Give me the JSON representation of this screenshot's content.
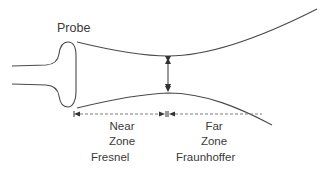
{
  "diagram": {
    "probe_label": "Probe",
    "near_zone": {
      "line1": "Near",
      "line2": "Zone",
      "name": "Fresnel"
    },
    "far_zone": {
      "line1": "Far",
      "line2": "Zone",
      "name": "Fraunhoffer"
    },
    "colors": {
      "stroke": "#4a4a4a",
      "text": "#3a3a3a",
      "dashed": "#7a7a7a"
    }
  }
}
